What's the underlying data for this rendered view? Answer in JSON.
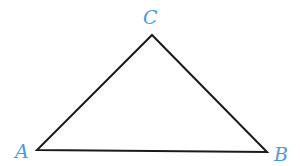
{
  "diagram": {
    "type": "triangle",
    "stroke_color": "#1a1a1a",
    "label_color": "#4a9bd4",
    "vertices": [
      {
        "name": "A",
        "label": "A",
        "x": 37,
        "y": 150
      },
      {
        "name": "B",
        "label": "B",
        "x": 267,
        "y": 152
      },
      {
        "name": "C",
        "label": "C",
        "x": 152,
        "y": 35
      }
    ]
  }
}
